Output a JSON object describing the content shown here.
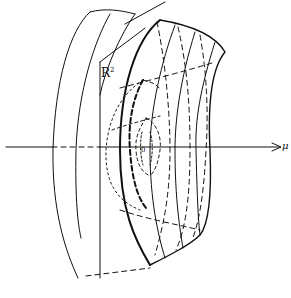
{
  "diagram": {
    "labels": {
      "plane_label": "R",
      "plane_label_sup": "2",
      "axis_label": "μ",
      "origin_label": "0"
    },
    "colors": {
      "ink": "#111111",
      "background": "#ffffff"
    }
  }
}
